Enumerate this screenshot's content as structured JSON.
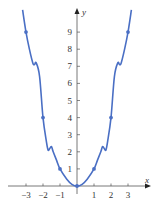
{
  "chart_data": {
    "type": "line",
    "title": "",
    "xlabel": "x",
    "ylabel": "y",
    "xlim": [
      -3.5,
      4
    ],
    "ylim": [
      -0.5,
      9.8
    ],
    "grid": false,
    "legend": null,
    "x_ticks": [
      -3,
      -2,
      -1,
      1,
      2,
      3
    ],
    "x_tick_labels": [
      "−3",
      "−2",
      "−1",
      "1",
      "2",
      "3"
    ],
    "y_ticks": [
      1,
      2,
      3,
      4,
      5,
      6,
      7,
      8,
      9
    ],
    "y_tick_labels": [
      "1",
      "2",
      "3",
      "4",
      "5",
      "6",
      "7",
      "8",
      "9"
    ],
    "series": [
      {
        "name": "curve",
        "color": "#4a6fc4",
        "description": "wiggly even function passing through (n, n^2) at integers",
        "x": [
          -3.2,
          -3,
          -2.8,
          -2.6,
          -2.5,
          -2.4,
          -2.2,
          -2,
          -1.8,
          -1.7,
          -1.6,
          -1.5,
          -1.4,
          -1.2,
          -1,
          -0.6,
          -0.3,
          0,
          0.3,
          0.6,
          1,
          1.2,
          1.4,
          1.5,
          1.6,
          1.7,
          1.8,
          2,
          2.2,
          2.4,
          2.5,
          2.6,
          2.8,
          3,
          3.2
        ],
        "y": [
          10.3,
          9,
          8.0,
          7.2,
          7.1,
          7.2,
          6.4,
          4.0,
          2.6,
          2.1,
          2.2,
          2.3,
          2.0,
          1.5,
          1.0,
          0.4,
          0.1,
          0,
          0.1,
          0.4,
          1.0,
          1.5,
          2.0,
          2.3,
          2.2,
          2.1,
          2.6,
          4.0,
          6.4,
          7.2,
          7.1,
          7.2,
          8.0,
          9,
          10.3
        ]
      }
    ],
    "marked_points": [
      {
        "x": -3,
        "y": 9
      },
      {
        "x": -2,
        "y": 4
      },
      {
        "x": -1,
        "y": 1
      },
      {
        "x": 0,
        "y": 0
      },
      {
        "x": 1,
        "y": 1
      },
      {
        "x": 2,
        "y": 4
      },
      {
        "x": 3,
        "y": 9
      }
    ]
  },
  "labels": {
    "x_axis": "x",
    "y_axis": "y"
  }
}
